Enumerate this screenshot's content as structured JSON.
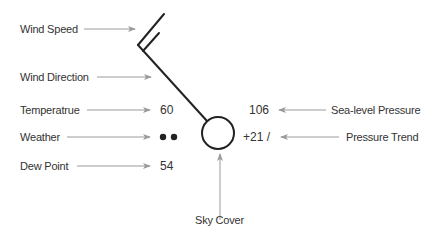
{
  "diagram": {
    "labels": {
      "wind_speed": "Wind Speed",
      "wind_direction": "Wind Direction",
      "temperature": "Temperatrue",
      "weather": "Weather",
      "dew_point": "Dew Point",
      "sea_level_pressure": "Sea-level Pressure",
      "pressure_trend": "Pressure Trend",
      "sky_cover": "Sky Cover"
    },
    "values": {
      "temperature": "60",
      "weather": "●●",
      "dew_point": "54",
      "sea_level_pressure": "106",
      "pressure_trend": "+21 /"
    },
    "colors": {
      "text": "#333333",
      "arrow": "#9a9a9a",
      "symbol": "#222222"
    }
  }
}
